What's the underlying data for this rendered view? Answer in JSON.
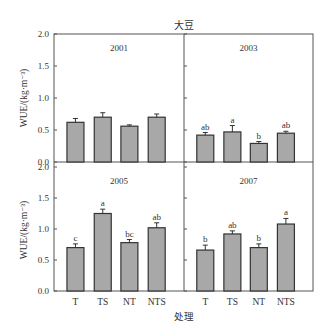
{
  "title": "大豆",
  "xlabel": "处理",
  "ylabel": "WUE/(kg·m⁻³)",
  "colors": {
    "bar": "#a8a8a8",
    "bar_edge": "#333333",
    "axis": "#555555"
  },
  "chart_data": [
    {
      "type": "bar",
      "panel": "2001",
      "categories": [
        "T",
        "TS",
        "NT",
        "NTS"
      ],
      "values": [
        0.62,
        0.7,
        0.56,
        0.7
      ],
      "errors": [
        0.06,
        0.07,
        0.02,
        0.05
      ],
      "significance": [
        "",
        "",
        "",
        ""
      ],
      "ylabel": "WUE/(kg·m⁻³)",
      "ylim": [
        0,
        2.0
      ],
      "yticks": [
        "0.0",
        "0.5",
        "1.0",
        "1.5",
        "2.0"
      ]
    },
    {
      "type": "bar",
      "panel": "2003",
      "categories": [
        "T",
        "TS",
        "NT",
        "NTS"
      ],
      "values": [
        0.42,
        0.47,
        0.29,
        0.45
      ],
      "errors": [
        0.04,
        0.1,
        0.03,
        0.03
      ],
      "significance": [
        "ab",
        "a",
        "b",
        "ab"
      ],
      "ylim": [
        0,
        2.0
      ]
    },
    {
      "type": "bar",
      "panel": "2005",
      "categories": [
        "T",
        "TS",
        "NT",
        "NTS"
      ],
      "values": [
        0.7,
        1.25,
        0.78,
        1.02
      ],
      "errors": [
        0.06,
        0.07,
        0.05,
        0.08
      ],
      "significance": [
        "c",
        "a",
        "bc",
        "ab"
      ],
      "ylabel": "WUE/(kg·m⁻³)",
      "xlabel": "处理",
      "ylim": [
        0,
        2.0
      ],
      "yticks": [
        "0.0",
        "0.5",
        "1.0",
        "1.5",
        "2.0"
      ]
    },
    {
      "type": "bar",
      "panel": "2007",
      "categories": [
        "T",
        "TS",
        "NT",
        "NTS"
      ],
      "values": [
        0.66,
        0.92,
        0.7,
        1.08
      ],
      "errors": [
        0.08,
        0.05,
        0.06,
        0.09
      ],
      "significance": [
        "b",
        "ab",
        "b",
        "a"
      ],
      "xlabel": "处理",
      "ylim": [
        0,
        2.0
      ]
    }
  ]
}
